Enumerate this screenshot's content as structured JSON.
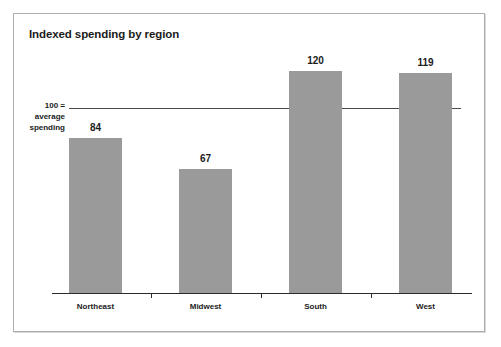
{
  "chart_data": {
    "type": "bar",
    "title": "Indexed spending by region",
    "categories": [
      "Northeast",
      "Midwest",
      "South",
      "West"
    ],
    "values": [
      84,
      67,
      120,
      119
    ],
    "value_labels": [
      "84",
      "67",
      "120",
      "119"
    ],
    "xlabel": "",
    "ylabel": "",
    "ylim": [
      0,
      160
    ],
    "grid": false,
    "legend": null,
    "reference_line": {
      "value": 100,
      "label_lines": [
        "100 =",
        "average",
        "spending"
      ]
    },
    "annotations": [],
    "colors": {
      "bar_fill": "#9a9a9a",
      "axis": "#2b2b2b",
      "reference_line": "#4a4a4a",
      "text": "#1b1b1b",
      "frame_border": "#adadad",
      "background": "#ffffff"
    }
  }
}
